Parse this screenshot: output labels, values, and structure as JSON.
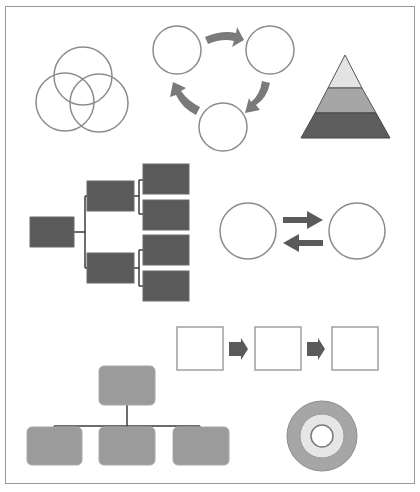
{
  "canvas": {
    "title": "Diagram shape gallery",
    "colors": {
      "outline": "#8c8c8c",
      "dark_fill": "#5a5a5a",
      "medium_fill": "#9b9b9b",
      "light_fill": "#d9d9d9",
      "arrow_fill": "#7a7a7a",
      "connector": "#3c3c3c",
      "frame": "#9a9a9a"
    }
  },
  "diagrams": [
    {
      "id": "venn",
      "label": "Venn diagram",
      "circle_count": 3
    },
    {
      "id": "cycle",
      "label": "Cycle diagram",
      "node_count": 3,
      "arrow_count": 3
    },
    {
      "id": "pyramid",
      "label": "Pyramid diagram",
      "levels": [
        "top",
        "middle",
        "bottom"
      ]
    },
    {
      "id": "hierarchy-horizontal",
      "label": "Horizontal hierarchy",
      "levels": [
        1,
        2,
        4
      ]
    },
    {
      "id": "bidirectional",
      "label": "Bidirectional relationship",
      "node_count": 2,
      "arrow_count": 2
    },
    {
      "id": "process",
      "label": "Process flow",
      "step_count": 3,
      "arrow_count": 2
    },
    {
      "id": "org-chart",
      "label": "Organization chart",
      "levels": [
        1,
        3
      ]
    },
    {
      "id": "target",
      "label": "Target diagram",
      "ring_count": 3
    }
  ]
}
